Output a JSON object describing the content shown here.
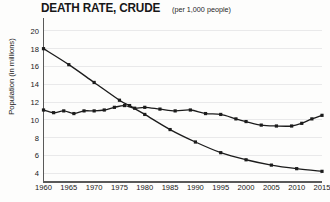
{
  "chart_data": {
    "type": "line",
    "title": "DEATH RATE, CRUDE",
    "subtitle": "(per 1,000 people)",
    "xlabel": "",
    "ylabel": "Population (in millions)",
    "xlim": [
      1960,
      2015
    ],
    "ylim": [
      3,
      21
    ],
    "grid": true,
    "legend": "none",
    "y_ticks": [
      20,
      18,
      16,
      14,
      12,
      10,
      8,
      6,
      4
    ],
    "x_ticks": [
      1960,
      1965,
      1970,
      1975,
      1980,
      1985,
      1990,
      1995,
      2000,
      2005,
      2010,
      2015
    ],
    "series": [
      {
        "name": "declining-series",
        "marker": "square",
        "x": [
          1960,
          1965,
          1970,
          1975,
          1977,
          1980,
          1985,
          1990,
          1995,
          2000,
          2005,
          2010,
          2015
        ],
        "values": [
          18.0,
          16.2,
          14.2,
          12.2,
          11.6,
          10.6,
          8.9,
          7.5,
          6.3,
          5.5,
          4.9,
          4.5,
          4.2
        ]
      },
      {
        "name": "flat-rising-series",
        "marker": "square",
        "x": [
          1960,
          1962,
          1964,
          1966,
          1968,
          1970,
          1972,
          1974,
          1976,
          1978,
          1980,
          1983,
          1986,
          1989,
          1992,
          1995,
          1998,
          2000,
          2003,
          2006,
          2009,
          2011,
          2013,
          2015
        ],
        "values": [
          11.1,
          10.8,
          11.0,
          10.7,
          11.0,
          11.0,
          11.1,
          11.4,
          11.6,
          11.3,
          11.4,
          11.2,
          11.0,
          11.1,
          10.7,
          10.6,
          10.1,
          9.8,
          9.4,
          9.3,
          9.3,
          9.6,
          10.1,
          10.5
        ]
      }
    ]
  }
}
